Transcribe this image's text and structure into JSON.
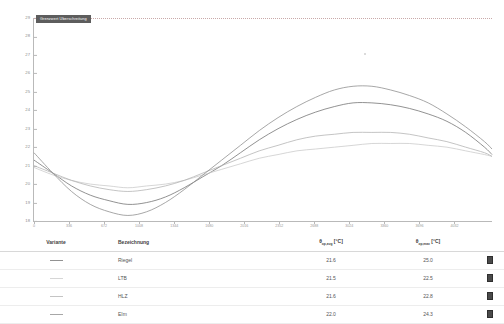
{
  "chart_data": {
    "type": "line",
    "title": "",
    "xlabel": "",
    "ylabel": "",
    "grid": false,
    "legend_position": "none",
    "xlim": [
      0,
      4392
    ],
    "ylim": [
      18,
      29
    ],
    "ytick_labels": [
      "29",
      "28",
      "27",
      "26",
      "25",
      "24",
      "23",
      "22",
      "21",
      "20",
      "19",
      "18"
    ],
    "ytick_values": [
      29,
      28,
      27,
      26,
      25,
      24,
      23,
      22,
      21,
      20,
      19,
      18
    ],
    "xtick_labels": [
      "0",
      "336",
      "672",
      "1008",
      "1344",
      "1680",
      "2016",
      "2352",
      "2688",
      "3024",
      "3360",
      "3696",
      "4032"
    ],
    "xtick_values": [
      0,
      336,
      672,
      1008,
      1344,
      1680,
      2016,
      2352,
      2688,
      3024,
      3360,
      3696,
      4032
    ],
    "annotations": [
      {
        "name": "limit-line",
        "label": "Grenzwert Uberschreitung",
        "y": 29,
        "style": "dotted",
        "color": "#c9a9a9"
      }
    ],
    "x": [
      0,
      180,
      360,
      540,
      720,
      900,
      1080,
      1260,
      1440,
      1620,
      1800,
      1980,
      2160,
      2340,
      2520,
      2700,
      2880,
      3060,
      3240,
      3420,
      3600,
      3780,
      3960,
      4140,
      4320,
      4392
    ],
    "series": [
      {
        "name": "Riegel",
        "color": "#6e6e6e",
        "values": [
          21.3,
          20.6,
          19.9,
          19.4,
          19.1,
          18.9,
          19.0,
          19.3,
          19.8,
          20.4,
          21.0,
          21.7,
          22.4,
          23.0,
          23.5,
          23.9,
          24.2,
          24.4,
          24.4,
          24.3,
          24.1,
          23.8,
          23.4,
          22.8,
          22.0,
          21.6
        ]
      },
      {
        "name": "LTB",
        "color": "#c8c8c8",
        "values": [
          20.9,
          20.5,
          20.2,
          20.0,
          19.9,
          19.8,
          19.9,
          20.0,
          20.2,
          20.5,
          20.8,
          21.1,
          21.4,
          21.6,
          21.8,
          21.9,
          22.0,
          22.1,
          22.2,
          22.2,
          22.2,
          22.1,
          22.0,
          21.8,
          21.6,
          21.5
        ]
      },
      {
        "name": "HLZ",
        "color": "#b0b0b0",
        "values": [
          21.0,
          20.6,
          20.2,
          19.9,
          19.7,
          19.6,
          19.7,
          19.9,
          20.2,
          20.6,
          21.0,
          21.4,
          21.8,
          22.1,
          22.4,
          22.6,
          22.7,
          22.8,
          22.8,
          22.8,
          22.7,
          22.5,
          22.3,
          22.0,
          21.7,
          21.5
        ]
      },
      {
        "name": "EIm",
        "color": "#8a8a8a",
        "values": [
          21.7,
          20.6,
          19.6,
          18.9,
          18.5,
          18.3,
          18.5,
          19.0,
          19.7,
          20.5,
          21.3,
          22.1,
          22.9,
          23.6,
          24.2,
          24.7,
          25.1,
          25.3,
          25.3,
          25.1,
          24.8,
          24.4,
          23.8,
          23.1,
          22.3,
          21.9
        ]
      }
    ]
  },
  "table": {
    "headers": {
      "variante": "Variante",
      "bezeichnung": "Bezeichnung",
      "avg_main": "θ",
      "avg_sub": "op,avg",
      "avg_unit": " [°C]",
      "max_main": "θ",
      "max_sub": "op,max",
      "max_unit": " [°C]",
      "swatch": ""
    },
    "rows": [
      {
        "variante": "",
        "bezeichnung": "Riegel",
        "avg": "21.6",
        "max": "25.0",
        "line_color": "#6e6e6e",
        "line_style": "solid",
        "swatch_color": "#4a4a4a"
      },
      {
        "variante": "",
        "bezeichnung": "LTB",
        "avg": "21.5",
        "max": "22.5",
        "line_color": "#c8c8c8",
        "line_style": "solid",
        "swatch_color": "#4a4a4a"
      },
      {
        "variante": "",
        "bezeichnung": "HLZ",
        "avg": "21.6",
        "max": "22.8",
        "line_color": "#b0b0b0",
        "line_style": "solid",
        "swatch_color": "#4a4a4a"
      },
      {
        "variante": "",
        "bezeichnung": "EIm",
        "avg": "22.0",
        "max": "24.3",
        "line_color": "#8a8a8a",
        "line_style": "solid",
        "swatch_color": "#4a4a4a"
      }
    ]
  }
}
